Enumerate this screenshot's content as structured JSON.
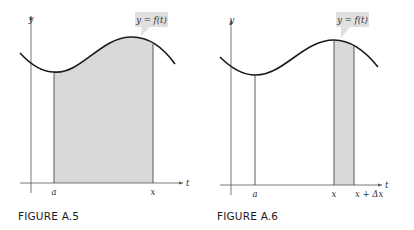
{
  "figures": [
    {
      "caption": "FIGURE A.5",
      "curve_label": "y = f(t)",
      "y_axis_label": "y",
      "x_axis_label": "t",
      "tick_labels": [
        "a",
        "x"
      ],
      "shaded_region": "area under curve from a to x"
    },
    {
      "caption": "FIGURE A.6",
      "curve_label": "y = f(t)",
      "y_axis_label": "y",
      "x_axis_label": "t",
      "tick_labels": [
        "a",
        "x",
        "x + Δx"
      ],
      "shaded_region": "thin strip from x to x + Δx"
    }
  ],
  "colors": {
    "shade": "#d9d9d9",
    "curve": "#1a1a1a",
    "axis": "#555555",
    "label_box": "#e0e0e0"
  }
}
